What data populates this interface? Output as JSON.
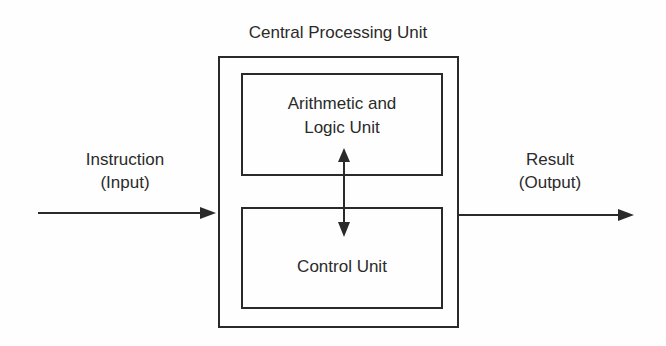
{
  "diagram": {
    "title": "Central Processing Unit",
    "alu": {
      "line1": "Arithmetic and",
      "line2": "Logic Unit"
    },
    "control_unit": {
      "label": "Control Unit"
    },
    "input": {
      "line1": "Instruction",
      "line2": "(Input)"
    },
    "output": {
      "line1": "Result",
      "line2": "(Output)"
    },
    "colors": {
      "stroke": "#2a2a2a",
      "background": "#fefefe"
    }
  }
}
